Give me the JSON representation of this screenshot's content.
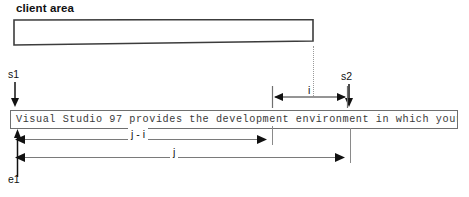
{
  "diagram": {
    "title_label": "client area",
    "strip_text": "Visual Studio 97 provides the development environment in which your...",
    "markers": {
      "s1": "s1",
      "s2": "s2",
      "e1": "e1"
    },
    "dimensions": {
      "i": "i",
      "j_minus_i": "j - i",
      "j": "j"
    },
    "colors": {
      "ink": "#111111",
      "strip_border": "#6f6f6f",
      "strip_text": "#3a3a3a",
      "guide": "#9a9a9a",
      "background": "#ffffff"
    }
  }
}
